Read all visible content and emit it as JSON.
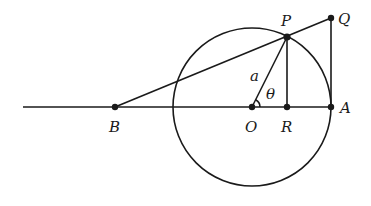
{
  "diagram": {
    "type": "geometry",
    "points": {
      "B": {
        "label": "B",
        "x": 115,
        "y": 107
      },
      "O": {
        "label": "O",
        "x": 252,
        "y": 107
      },
      "R": {
        "label": "R",
        "x": 287,
        "y": 107
      },
      "A": {
        "label": "A",
        "x": 331,
        "y": 107
      },
      "P": {
        "label": "P",
        "x": 287,
        "y": 37
      },
      "Q": {
        "label": "Q",
        "x": 331,
        "y": 18
      }
    },
    "circle": {
      "cx": 252,
      "cy": 107,
      "r": 79
    },
    "labels": {
      "radius": "a",
      "angle": "θ"
    },
    "colors": {
      "ink": "#1a1a1a",
      "background": "#ffffff"
    }
  }
}
